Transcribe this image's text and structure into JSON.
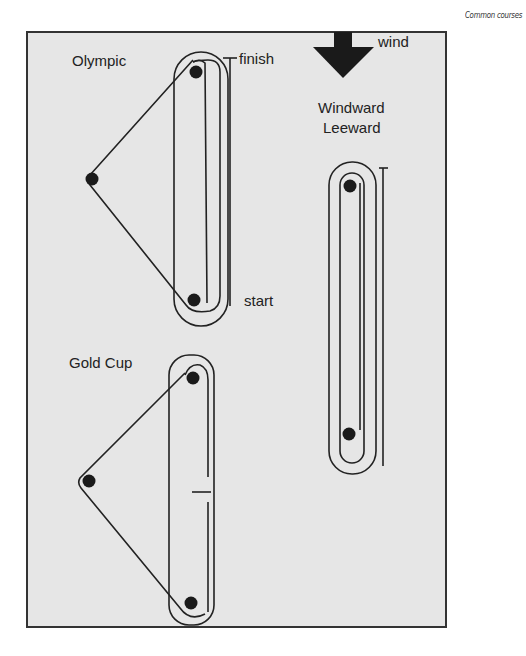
{
  "caption": "Common courses",
  "wind": {
    "label": "wind",
    "direction": "down"
  },
  "courses": [
    {
      "name": "Olympic",
      "labels": {
        "finish": "finish",
        "start": "start"
      }
    },
    {
      "name": "Gold Cup"
    },
    {
      "name_line1": "Windward",
      "name_line2": "Leeward"
    }
  ],
  "colors": {
    "background": "#e6e6e6",
    "line": "#222222",
    "mark": "#1a1a1a",
    "frame": "#333333"
  }
}
